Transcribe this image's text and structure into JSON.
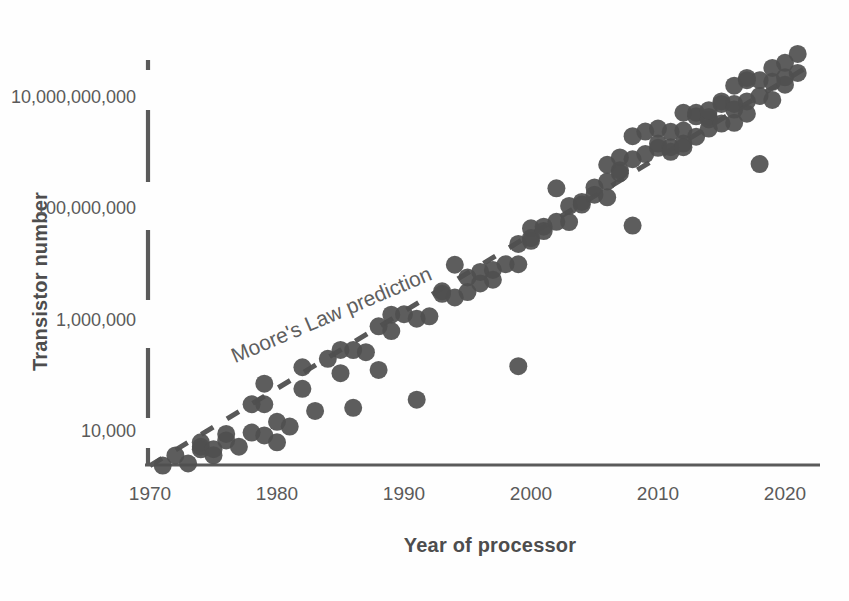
{
  "chart_data": {
    "type": "scatter",
    "title": "",
    "xlabel": "Year of processor",
    "ylabel": "Transistor number",
    "xlim": [
      1970,
      2022
    ],
    "ylim": [
      2000,
      40000000000
    ],
    "yscale": "log",
    "grid": false,
    "legend": null,
    "xticks": [
      "1970",
      "1980",
      "1990",
      "2000",
      "2010",
      "2020"
    ],
    "xtick_values": [
      1970,
      1980,
      1990,
      2000,
      2010,
      2020
    ],
    "yticks": [
      "10,000",
      "1,000,000",
      "100,000,000",
      "10,000,000,000"
    ],
    "ytick_values": [
      10000,
      1000000,
      100000000,
      10000000000
    ],
    "annotations": [
      {
        "text": "Moore's Law prediction",
        "x": 1984.5,
        "y": 900000,
        "rotation": -23
      }
    ],
    "trendline": {
      "label": "Moore's Law prediction",
      "style": "dashed",
      "color": "#585858",
      "x_start": 1970,
      "y_start": 2300,
      "x_end": 2022,
      "y_end": 36000000000
    },
    "marker": {
      "shape": "circle",
      "color": "#4f4f4f",
      "size": 9,
      "opacity": 0.92
    },
    "series": [
      {
        "name": "Processors",
        "points": [
          [
            1971,
            2300
          ],
          [
            1972,
            3500
          ],
          [
            1973,
            2500
          ],
          [
            1974,
            4500
          ],
          [
            1974,
            5000
          ],
          [
            1974,
            6000
          ],
          [
            1975,
            4528
          ],
          [
            1975,
            3510
          ],
          [
            1976,
            8500
          ],
          [
            1976,
            6500
          ],
          [
            1977,
            5000
          ],
          [
            1978,
            29000
          ],
          [
            1978,
            9000
          ],
          [
            1979,
            29000
          ],
          [
            1979,
            8000
          ],
          [
            1979,
            68000
          ],
          [
            1980,
            14000
          ],
          [
            1980,
            6000
          ],
          [
            1981,
            11500
          ],
          [
            1982,
            55000
          ],
          [
            1982,
            134000
          ],
          [
            1983,
            22000
          ],
          [
            1984,
            190000
          ],
          [
            1985,
            105000
          ],
          [
            1985,
            275000
          ],
          [
            1986,
            273000
          ],
          [
            1986,
            25000
          ],
          [
            1987,
            250000
          ],
          [
            1988,
            120000
          ],
          [
            1988,
            730000
          ],
          [
            1989,
            1180000
          ],
          [
            1989,
            600000
          ],
          [
            1990,
            1200000
          ],
          [
            1991,
            1000000
          ],
          [
            1991,
            35000
          ],
          [
            1992,
            1100000
          ],
          [
            1993,
            3100000
          ],
          [
            1993,
            2800000
          ],
          [
            1994,
            2400000
          ],
          [
            1994,
            9300000
          ],
          [
            1995,
            5500000
          ],
          [
            1995,
            3000000
          ],
          [
            1996,
            4300000
          ],
          [
            1996,
            6900000
          ],
          [
            1997,
            7500000
          ],
          [
            1997,
            5000000
          ],
          [
            1998,
            9500000
          ],
          [
            1999,
            22000000
          ],
          [
            1999,
            140000
          ],
          [
            1999,
            9500000
          ],
          [
            2000,
            42000000
          ],
          [
            2000,
            25000000
          ],
          [
            2000,
            28000000
          ],
          [
            2001,
            45000000
          ],
          [
            2001,
            37500000
          ],
          [
            2002,
            220000000
          ],
          [
            2002,
            55000000
          ],
          [
            2003,
            54300000
          ],
          [
            2003,
            105900000
          ],
          [
            2004,
            125000000
          ],
          [
            2004,
            112000000
          ],
          [
            2005,
            169000000
          ],
          [
            2005,
            228000000
          ],
          [
            2006,
            291000000
          ],
          [
            2006,
            151000000
          ],
          [
            2006,
            582000000
          ],
          [
            2007,
            789000000
          ],
          [
            2007,
            463000000
          ],
          [
            2007,
            410000000
          ],
          [
            2008,
            731000000
          ],
          [
            2008,
            1900000000
          ],
          [
            2008,
            47000000
          ],
          [
            2009,
            904000000
          ],
          [
            2009,
            2300000000
          ],
          [
            2010,
            1170000000
          ],
          [
            2010,
            1400000000
          ],
          [
            2010,
            2600000000
          ],
          [
            2011,
            1200000000
          ],
          [
            2011,
            2270000000
          ],
          [
            2011,
            995000000
          ],
          [
            2012,
            1400000000
          ],
          [
            2012,
            2400000000
          ],
          [
            2012,
            5000000000
          ],
          [
            2012,
            1200000000
          ],
          [
            2013,
            1860000000
          ],
          [
            2013,
            4310000000
          ],
          [
            2013,
            5000000000
          ],
          [
            2014,
            4200000000
          ],
          [
            2014,
            3800000000
          ],
          [
            2014,
            5560000000
          ],
          [
            2014,
            2600000000
          ],
          [
            2015,
            3200000000
          ],
          [
            2015,
            8000000000
          ],
          [
            2015,
            7200000000
          ],
          [
            2016,
            7200000000
          ],
          [
            2016,
            15300000000
          ],
          [
            2016,
            3300000000
          ],
          [
            2016,
            5700000000
          ],
          [
            2017,
            19200000000
          ],
          [
            2017,
            8000000000
          ],
          [
            2017,
            4800000000
          ],
          [
            2017,
            21100000000
          ],
          [
            2018,
            19200000000
          ],
          [
            2018,
            10000000000
          ],
          [
            2018,
            600000000
          ],
          [
            2019,
            32000000000
          ],
          [
            2019,
            18000000000
          ],
          [
            2019,
            8500000000
          ],
          [
            2020,
            39500000000
          ],
          [
            2020,
            21700000000
          ],
          [
            2020,
            16000000000
          ],
          [
            2021,
            26000000000
          ],
          [
            2021,
            57000000000
          ]
        ]
      }
    ]
  },
  "axis": {
    "y_title": "Transistor number",
    "x_title": "Year of processor"
  }
}
